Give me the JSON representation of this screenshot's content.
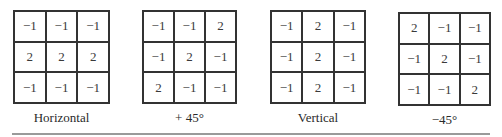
{
  "masks": [
    {
      "label": "Horizontal",
      "values": [
        [
          "−1",
          "−1",
          "−1"
        ],
        [
          "2",
          "2",
          "2"
        ],
        [
          "−1",
          "−1",
          "−1"
        ]
      ]
    },
    {
      "label": "+ 45°",
      "values": [
        [
          "−1",
          "−1",
          "2"
        ],
        [
          "−1",
          "2",
          "−1"
        ],
        [
          "2",
          "−1",
          "−1"
        ]
      ]
    },
    {
      "label": "Vertical",
      "values": [
        [
          "−1",
          "2",
          "−1"
        ],
        [
          "−1",
          "2",
          "−1"
        ],
        [
          "−1",
          "2",
          "−1"
        ]
      ]
    },
    {
      "label": "−45°",
      "values": [
        [
          "2",
          "−1",
          "−1"
        ],
        [
          "−1",
          "2",
          "−1"
        ],
        [
          "−1",
          "−1",
          "2"
        ]
      ]
    }
  ]
}
